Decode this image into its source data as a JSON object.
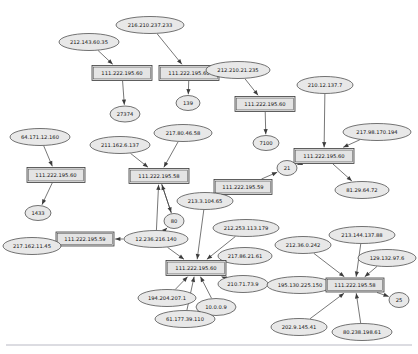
{
  "diagram": {
    "type": "directed-graph",
    "background_color": "#ffffff",
    "node_fill": "#e8e8e8",
    "node_stroke": "#3a3a3a",
    "edge_color": "#3c3c3c",
    "viewbox": "0 0 418 354"
  },
  "nodes": [
    {
      "id": "n1",
      "label": "216.210.237.233",
      "shape": "ellipse",
      "cx": 150,
      "cy": 25,
      "rx": 34,
      "ry": 8.5,
      "font": 5.2
    },
    {
      "id": "n2",
      "label": "212.143.60.35",
      "shape": "ellipse",
      "cx": 89,
      "cy": 42,
      "rx": 30,
      "ry": 8.5,
      "font": 5.2
    },
    {
      "id": "n3",
      "label": "111.222.195.60",
      "shape": "box",
      "cx": 122,
      "cy": 73,
      "w": 60,
      "h": 15,
      "font": 5.2
    },
    {
      "id": "n4",
      "label": "111.222.195.60",
      "shape": "box",
      "cx": 189,
      "cy": 73,
      "w": 60,
      "h": 15,
      "font": 5.2
    },
    {
      "id": "n5",
      "label": "212.210.21.235",
      "shape": "ellipse",
      "cx": 238,
      "cy": 70,
      "rx": 32,
      "ry": 8.5,
      "font": 5.2
    },
    {
      "id": "n6",
      "label": "210.12.137.7",
      "shape": "ellipse",
      "cx": 325,
      "cy": 85,
      "rx": 28,
      "ry": 8.5,
      "font": 5.2
    },
    {
      "id": "n7",
      "label": "27374",
      "shape": "ellipse",
      "cx": 125,
      "cy": 114,
      "rx": 15,
      "ry": 8,
      "font": 5.2
    },
    {
      "id": "n8",
      "label": "139",
      "shape": "ellipse",
      "cx": 188,
      "cy": 103,
      "rx": 12,
      "ry": 7.5,
      "font": 5.2
    },
    {
      "id": "n9",
      "label": "111.222.195.60",
      "shape": "box",
      "cx": 265,
      "cy": 104,
      "w": 60,
      "h": 15,
      "font": 5.2
    },
    {
      "id": "n10",
      "label": "217.98.170.194",
      "shape": "ellipse",
      "cx": 377,
      "cy": 132,
      "rx": 34,
      "ry": 8.5,
      "font": 5.2
    },
    {
      "id": "n11",
      "label": "7100",
      "shape": "ellipse",
      "cx": 266,
      "cy": 143,
      "rx": 13,
      "ry": 7.5,
      "font": 5.2
    },
    {
      "id": "n12",
      "label": "111.222.195.60",
      "shape": "box",
      "cx": 324,
      "cy": 156,
      "w": 60,
      "h": 15,
      "font": 5.2
    },
    {
      "id": "n13",
      "label": "21",
      "shape": "ellipse",
      "cx": 287,
      "cy": 168,
      "rx": 10,
      "ry": 7.5,
      "font": 5.2
    },
    {
      "id": "n14",
      "label": "64.171.12.160",
      "shape": "ellipse",
      "cx": 40,
      "cy": 137,
      "rx": 30,
      "ry": 8.5,
      "font": 5.2
    },
    {
      "id": "n15",
      "label": "211.162.6.137",
      "shape": "ellipse",
      "cx": 120,
      "cy": 145,
      "rx": 30,
      "ry": 8.5,
      "font": 5.2
    },
    {
      "id": "n16",
      "label": "217.80.46.58",
      "shape": "ellipse",
      "cx": 183,
      "cy": 133,
      "rx": 29,
      "ry": 8.5,
      "font": 5.2
    },
    {
      "id": "n17",
      "label": "111.222.195.58",
      "shape": "box",
      "cx": 159,
      "cy": 176,
      "w": 60,
      "h": 15,
      "font": 5.2
    },
    {
      "id": "n18",
      "label": "111.222.195.60",
      "shape": "box",
      "cx": 56,
      "cy": 175,
      "w": 58,
      "h": 15,
      "font": 5.2
    },
    {
      "id": "n19",
      "label": "81.29.64.72",
      "shape": "ellipse",
      "cx": 362,
      "cy": 190,
      "rx": 27,
      "ry": 8.5,
      "font": 5.2
    },
    {
      "id": "n20",
      "label": "111.222.195.59",
      "shape": "box",
      "cx": 243,
      "cy": 187,
      "w": 58,
      "h": 15,
      "font": 5.2
    },
    {
      "id": "n21",
      "label": "213.3.104.65",
      "shape": "ellipse",
      "cx": 205,
      "cy": 201,
      "rx": 28,
      "ry": 8.5,
      "font": 5.2
    },
    {
      "id": "n22",
      "label": "1433",
      "shape": "ellipse",
      "cx": 38,
      "cy": 213,
      "rx": 13,
      "ry": 7.5,
      "font": 5.2
    },
    {
      "id": "n23",
      "label": "80",
      "shape": "ellipse",
      "cx": 174,
      "cy": 221,
      "rx": 10,
      "ry": 7.5,
      "font": 5.2
    },
    {
      "id": "n24",
      "label": "212.253.113.179",
      "shape": "ellipse",
      "cx": 246,
      "cy": 228,
      "rx": 33,
      "ry": 8.5,
      "font": 5.2
    },
    {
      "id": "n25",
      "label": "12.236.216.140",
      "shape": "ellipse",
      "cx": 156,
      "cy": 239,
      "rx": 32,
      "ry": 8.5,
      "font": 5.2
    },
    {
      "id": "n26",
      "label": "111.222.195.59",
      "shape": "box",
      "cx": 85,
      "cy": 239,
      "w": 58,
      "h": 14,
      "font": 5.2
    },
    {
      "id": "n27",
      "label": "217.162.11.45",
      "shape": "ellipse",
      "cx": 32,
      "cy": 246,
      "rx": 29,
      "ry": 8.5,
      "font": 5.2
    },
    {
      "id": "n28",
      "label": "217.86.21.61",
      "shape": "ellipse",
      "cx": 245,
      "cy": 256,
      "rx": 27,
      "ry": 8.5,
      "font": 5.2
    },
    {
      "id": "n29",
      "label": "212.36.0.242",
      "shape": "ellipse",
      "cx": 303,
      "cy": 245,
      "rx": 28,
      "ry": 8.5,
      "font": 5.2
    },
    {
      "id": "n30",
      "label": "213.144.137.88",
      "shape": "ellipse",
      "cx": 362,
      "cy": 235,
      "rx": 33,
      "ry": 8.5,
      "font": 5.2
    },
    {
      "id": "n31",
      "label": "129.132.97.6",
      "shape": "ellipse",
      "cx": 387,
      "cy": 258,
      "rx": 29,
      "ry": 8.5,
      "font": 5.2
    },
    {
      "id": "n32",
      "label": "111.222.195.60",
      "shape": "box",
      "cx": 196,
      "cy": 268,
      "w": 60,
      "h": 15,
      "font": 5.2
    },
    {
      "id": "n33",
      "label": "210.71.73.9",
      "shape": "ellipse",
      "cx": 243,
      "cy": 284,
      "rx": 25,
      "ry": 8.5,
      "font": 5.2
    },
    {
      "id": "n34",
      "label": "195.130.225.150",
      "shape": "ellipse",
      "cx": 300,
      "cy": 285,
      "rx": 33,
      "ry": 8.5,
      "font": 5.2
    },
    {
      "id": "n35",
      "label": "111.222.195.58",
      "shape": "box",
      "cx": 355,
      "cy": 285,
      "w": 58,
      "h": 14,
      "font": 5.2
    },
    {
      "id": "n36",
      "label": "25",
      "shape": "ellipse",
      "cx": 399,
      "cy": 300,
      "rx": 10,
      "ry": 7.5,
      "font": 5.2
    },
    {
      "id": "n37",
      "label": "194.204.207.1",
      "shape": "ellipse",
      "cx": 167,
      "cy": 298,
      "rx": 29,
      "ry": 8.5,
      "font": 5.2
    },
    {
      "id": "n38",
      "label": "10.0.0.9",
      "shape": "ellipse",
      "cx": 216,
      "cy": 307,
      "rx": 20,
      "ry": 8.5,
      "font": 5.2
    },
    {
      "id": "n39",
      "label": "61.177.39.110",
      "shape": "ellipse",
      "cx": 185,
      "cy": 319,
      "rx": 30,
      "ry": 8.5,
      "font": 5.2
    },
    {
      "id": "n40",
      "label": "202.9.145.41",
      "shape": "ellipse",
      "cx": 299,
      "cy": 327,
      "rx": 28,
      "ry": 8.5,
      "font": 5.2
    },
    {
      "id": "n41",
      "label": "80.238.198.61",
      "shape": "ellipse",
      "cx": 362,
      "cy": 332,
      "rx": 30,
      "ry": 8.5,
      "font": 5.2
    }
  ],
  "edges": [
    {
      "from": "n2",
      "to": "n3"
    },
    {
      "from": "n1",
      "to": "n4"
    },
    {
      "from": "n3",
      "to": "n7"
    },
    {
      "from": "n4",
      "to": "n8"
    },
    {
      "from": "n5",
      "to": "n9"
    },
    {
      "from": "n9",
      "to": "n11"
    },
    {
      "from": "n6",
      "to": "n12"
    },
    {
      "from": "n10",
      "to": "n12"
    },
    {
      "from": "n12",
      "to": "n13"
    },
    {
      "from": "n12",
      "to": "n19"
    },
    {
      "from": "n14",
      "to": "n18"
    },
    {
      "from": "n15",
      "to": "n17"
    },
    {
      "from": "n16",
      "to": "n17"
    },
    {
      "from": "n18",
      "to": "n22"
    },
    {
      "from": "n17",
      "to": "n23"
    },
    {
      "from": "n20",
      "to": "n13"
    },
    {
      "from": "n23",
      "to": "n17"
    },
    {
      "from": "n25",
      "to": "n26"
    },
    {
      "from": "n25",
      "to": "n17"
    },
    {
      "from": "n25",
      "to": "n23"
    },
    {
      "from": "n26",
      "to": "n27"
    },
    {
      "from": "n24",
      "to": "n32"
    },
    {
      "from": "n25",
      "to": "n32"
    },
    {
      "from": "n28",
      "to": "n32"
    },
    {
      "from": "n37",
      "to": "n32"
    },
    {
      "from": "n38",
      "to": "n32"
    },
    {
      "from": "n39",
      "to": "n32"
    },
    {
      "from": "n33",
      "to": "n32"
    },
    {
      "from": "n21",
      "to": "n32"
    },
    {
      "from": "n29",
      "to": "n35"
    },
    {
      "from": "n30",
      "to": "n35"
    },
    {
      "from": "n31",
      "to": "n35"
    },
    {
      "from": "n34",
      "to": "n35"
    },
    {
      "from": "n40",
      "to": "n35"
    },
    {
      "from": "n41",
      "to": "n35"
    },
    {
      "from": "n35",
      "to": "n36"
    }
  ]
}
